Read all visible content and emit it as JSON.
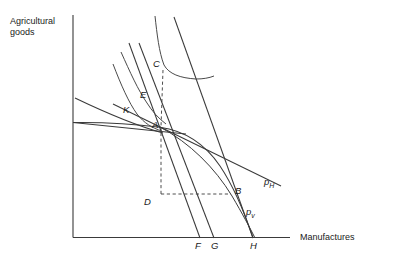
{
  "figure": {
    "axes": {
      "y_label": "Agricultural\ngoods",
      "y_label_line1": "Agricultural",
      "y_label_line2": "goods",
      "x_label": "Manufactures",
      "origin_x": 73,
      "origin_y": 237,
      "y_axis_top": 15,
      "x_axis_right": 290
    },
    "points": [
      {
        "id": "C",
        "label": "C",
        "x": 162,
        "y": 67,
        "desc": "consumption point on higher indifference curve"
      },
      {
        "id": "E",
        "label": "E",
        "x": 148,
        "y": 98,
        "desc": "point on intermediate indifference curve"
      },
      {
        "id": "K",
        "label": "K",
        "x": 133,
        "y": 113,
        "desc": "point on lower indifference curve"
      },
      {
        "id": "A",
        "label": "A",
        "x": 160,
        "y": 127,
        "desc": "production point on PPF where lines converge"
      },
      {
        "id": "D",
        "label": "D",
        "x": 160,
        "y": 195,
        "desc": "corner of dashed rectangle below A"
      },
      {
        "id": "B",
        "label": "B",
        "x": 231,
        "y": 193,
        "desc": "right end of dashed horizontal line"
      },
      {
        "id": "F",
        "label": "F",
        "x": 200,
        "y": 245,
        "desc": "x-axis intercept of inner budget line"
      },
      {
        "id": "G",
        "label": "G",
        "x": 214,
        "y": 245,
        "desc": "x-axis intercept of outer budget line"
      },
      {
        "id": "H",
        "label": "H",
        "x": 253,
        "y": 245,
        "desc": "x-axis intercept of PPF"
      }
    ],
    "price_lines": [
      {
        "id": "pH",
        "base": "p",
        "sub": "H",
        "x": 266,
        "y": 181,
        "desc": "world / home price line label"
      },
      {
        "id": "pv",
        "base": "p",
        "sub": "v",
        "x": 248,
        "y": 212,
        "desc": "domestic price line label"
      }
    ],
    "chart_type": "economics-diagram",
    "curves": {
      "ppf": "production possibility frontier from y-axis through A down to H",
      "indifference_high": "indifference curve through C",
      "indifference_mid": "indifference curve through E",
      "indifference_low": "indifference curve through K",
      "budget_F": "steep budget line through A to F",
      "budget_G": "steep budget line through A to G",
      "price_pH_line": "shallow line through A extending to lower right past pH label"
    }
  }
}
